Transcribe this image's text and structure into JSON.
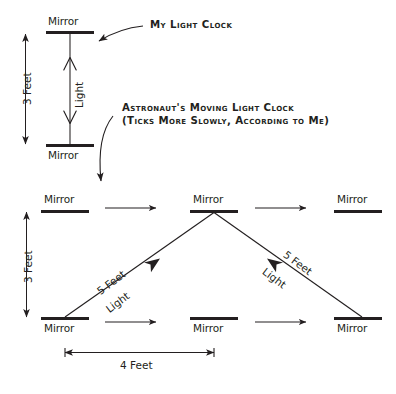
{
  "figure": {
    "ink_color": "#231f20",
    "background_color": "#ffffff"
  },
  "callouts": {
    "my_clock": "My Light Clock",
    "astronaut_line1": "Astronaut's Moving Light Clock",
    "astronaut_line2": "(Ticks More Slowly, According to Me)"
  },
  "stationary_clock": {
    "top_mirror_label": "Mirror",
    "bottom_mirror_label": "Mirror",
    "height_label": "3 Feet",
    "beam_label": "Light"
  },
  "moving_clock": {
    "height_label": "3 Feet",
    "base_label": "4 Feet",
    "top_mirrors": [
      {
        "label": "Mirror"
      },
      {
        "label": "Mirror"
      },
      {
        "label": "Mirror"
      }
    ],
    "bottom_mirrors": [
      {
        "label": "Mirror"
      },
      {
        "label": "Mirror"
      },
      {
        "label": "Mirror"
      }
    ],
    "beam_up": {
      "length_label": "5 Feet",
      "beam_label": "Light"
    },
    "beam_down": {
      "length_label": "5 Feet",
      "beam_label": "Light"
    }
  }
}
